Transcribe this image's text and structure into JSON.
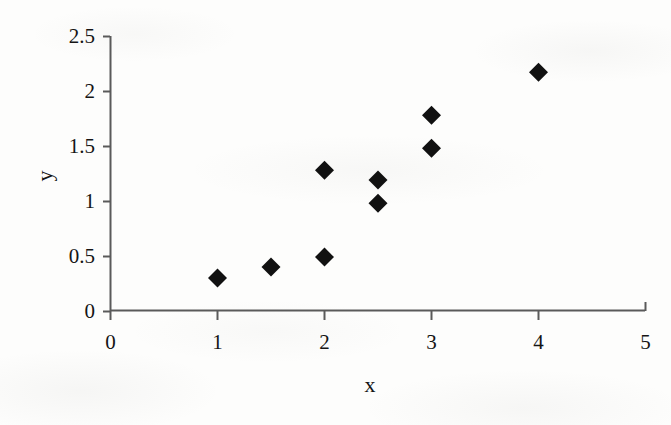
{
  "chart_data": {
    "type": "scatter",
    "title": "",
    "subtitle": "",
    "xlabel": "x",
    "ylabel": "y",
    "xlim": [
      0,
      5
    ],
    "ylim": [
      0,
      2.5
    ],
    "xticks": [
      "0",
      "1",
      "2",
      "3",
      "4",
      "5"
    ],
    "xtick_values": [
      0,
      1,
      2,
      3,
      4,
      5
    ],
    "yticks": [
      "0",
      "0.5",
      "1",
      "1.5",
      "2",
      "2.5"
    ],
    "ytick_values": [
      0,
      0.5,
      1,
      1.5,
      2,
      2.5
    ],
    "grid": false,
    "legend": false,
    "legend_position": "none",
    "marker": "diamond",
    "marker_color": "#111111",
    "axis_color": "#555555",
    "series": [
      {
        "name": "data",
        "x": [
          1,
          1.5,
          2,
          2,
          2.5,
          2.5,
          3,
          3,
          4
        ],
        "y": [
          0.3,
          0.4,
          0.49,
          1.28,
          1.19,
          0.98,
          1.78,
          1.48,
          2.17
        ],
        "points": [
          {
            "x": 1,
            "y": 0.3
          },
          {
            "x": 1.5,
            "y": 0.4
          },
          {
            "x": 2,
            "y": 0.49
          },
          {
            "x": 2,
            "y": 1.28
          },
          {
            "x": 2.5,
            "y": 1.19
          },
          {
            "x": 2.5,
            "y": 0.98
          },
          {
            "x": 3,
            "y": 1.78
          },
          {
            "x": 3,
            "y": 1.48
          },
          {
            "x": 4,
            "y": 2.17
          }
        ]
      }
    ]
  },
  "axes": {
    "x_title": "x",
    "y_title": "y"
  }
}
